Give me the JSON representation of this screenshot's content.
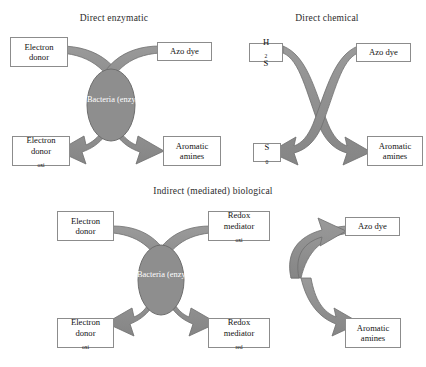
{
  "figure": {
    "background": "#ffffff",
    "arrow_color": "#8b8b8b",
    "arrow_stroke": "#6f6f6f",
    "ellipse_fill": "#8e8e8e",
    "ellipse_stroke": "#6e6e6e",
    "box_border": "#8c8c8c",
    "box_fill": "#ffffff",
    "text_color": "#131313"
  },
  "panels": [
    {
      "id": "direct-enzymatic",
      "title": "Direct enzymatic",
      "catalyst": {
        "line1": "Bacteria",
        "line2": "(enzyme)"
      },
      "nodes": {
        "top_left": {
          "line1": "Electron",
          "line2": "donor",
          "sub2": ""
        },
        "top_right": {
          "line1": "Azo dye",
          "line2": "",
          "sub2": ""
        },
        "bottom_left": {
          "line1": "Electron",
          "line2": "donor",
          "sub2": "oxi"
        },
        "bottom_right": {
          "line1": "Aromatic",
          "line2": "amines",
          "sub2": ""
        }
      }
    },
    {
      "id": "direct-chemical",
      "title": "Direct chemical",
      "catalyst": null,
      "nodes": {
        "top_left": {
          "line1": "H",
          "sub1": "2",
          "line1b": "S"
        },
        "top_right": {
          "line1": "Azo dye",
          "line2": "",
          "sub2": ""
        },
        "bottom_left": {
          "line1": "S",
          "sub1": "0",
          "line1b": ""
        },
        "bottom_right": {
          "line1": "Aromatic",
          "line2": "amines",
          "sub2": ""
        }
      }
    },
    {
      "id": "indirect-mediated-biological",
      "title": "Indirect (mediated) biological",
      "catalyst": {
        "line1": "Bacteria",
        "line2": "(enzyme)"
      },
      "nodes": {
        "top_left": {
          "line1": "Electron",
          "line2": "donor",
          "sub2": ""
        },
        "top_mid": {
          "line1": "Redox",
          "line2": "mediator",
          "sub2": "oxi"
        },
        "top_right": {
          "line1": "Azo dye",
          "line2": "",
          "sub2": ""
        },
        "bottom_left": {
          "line1": "Electron",
          "line2": "donor",
          "sub2": "oxi"
        },
        "bottom_mid": {
          "line1": "Redox",
          "line2": "mediator",
          "sub2": "red"
        },
        "bottom_right": {
          "line1": "Aromatic",
          "line2": "amines",
          "sub2": ""
        }
      }
    }
  ]
}
